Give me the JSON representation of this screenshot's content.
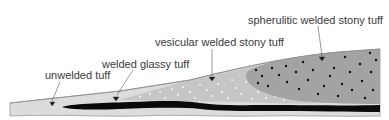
{
  "diagram": {
    "type": "geologic cross-section of welded ignimbrite zones",
    "labels": {
      "unwelded": "unwelded tuff",
      "welded_glassy": "welded glassy tuff",
      "vesicular": "vesicular welded stony tuff",
      "spherulitic": "spherulitic welded stony tuff"
    },
    "colors": {
      "background": "#ffffff",
      "unwelded_zone": "#dcdcdc",
      "vesicular_zone": "#c4c4c4",
      "spherulitic_zone": "#a3a3a3",
      "welded_glassy_layer": "#0a0a0a",
      "outline": "#8a8a8a",
      "text": "#3a3a3a",
      "vesicle_dots": "#f2f2f2",
      "spherulite_dots": "#111111"
    }
  }
}
